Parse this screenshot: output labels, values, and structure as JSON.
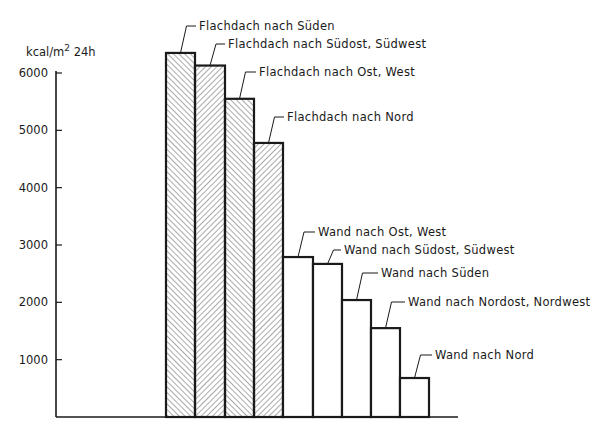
{
  "chart_data": {
    "type": "bar",
    "title": "",
    "xlabel": "",
    "ylabel": "kcal/m² 24h",
    "ylabel_parts": {
      "main": "kcal/m",
      "sup": "2",
      "tail": " 24h"
    },
    "ylim": [
      0,
      6000
    ],
    "yticks": [
      1000,
      2000,
      3000,
      4000,
      5000,
      6000
    ],
    "grid": false,
    "legend": "none (direct leader-line labels)",
    "categories": [
      "Flachdach nach Süden",
      "Flachdach nach Südost, Südwest",
      "Flachdach nach Ost, West",
      "Flachdach nach Nord",
      "Wand nach Ost, West",
      "Wand nach Südost, Südwest",
      "Wand nach Süden",
      "Wand nach Nordost, Nordwest",
      "Wand nach Nord"
    ],
    "values": [
      6350,
      6130,
      5550,
      4780,
      2790,
      2670,
      2040,
      1550,
      680
    ],
    "series": [
      {
        "name": "Flachdach",
        "style": "hatched",
        "indices": [
          0,
          1,
          2,
          3
        ]
      },
      {
        "name": "Wand",
        "style": "white",
        "indices": [
          4,
          5,
          6,
          7,
          8
        ]
      }
    ]
  },
  "colors": {
    "ink": "#1a1a1a",
    "hatch": "#555555",
    "background": "#ffffff"
  }
}
